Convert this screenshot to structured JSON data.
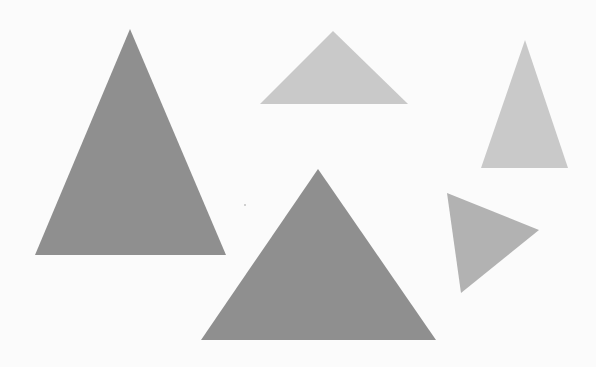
{
  "canvas": {
    "width": 596,
    "height": 367,
    "background": "#fbfbfb"
  },
  "colors": {
    "dark": "#8f8f8f",
    "light": "#c9c9c9",
    "medium": "#b2b2b2"
  },
  "triangles": [
    {
      "id": "large-left",
      "points": "130,29 35,255 226,255",
      "fill": "#8f8f8f"
    },
    {
      "id": "top-middle",
      "points": "333,31 260,104 408,104",
      "fill": "#c9c9c9"
    },
    {
      "id": "top-right",
      "points": "525,40 481,168 568,168",
      "fill": "#c9c9c9"
    },
    {
      "id": "large-bottom",
      "points": "318,169 201,340 436,340",
      "fill": "#8f8f8f"
    },
    {
      "id": "rotated-right",
      "points": "447,193 539,230 461,293",
      "fill": "#b2b2b2"
    }
  ],
  "specks": [
    {
      "cx": 245,
      "cy": 205,
      "r": 0.8,
      "fill": "#9a9a9a"
    }
  ]
}
